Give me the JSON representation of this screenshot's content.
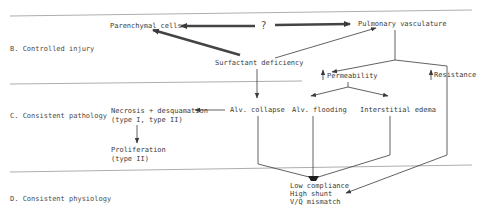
{
  "sections": {
    "b": "B.  Controlled injury",
    "c": "C.  Consistent pathology",
    "d": "D.  Consistent physiology"
  },
  "nodes": {
    "parenchymal_cells": "Parenchymal cells",
    "question": "?",
    "pulmonary_vasculature": "Pulmonary vasculature",
    "surfactant_deficiency": "Surfactant deficiency",
    "permeability": "Permeability",
    "resistance": "Resistance",
    "necrosis_line1": "Necrosis + desquamation",
    "necrosis_line2": "(type I, type II)",
    "alv_collapse": "Alv. collapse",
    "alv_flooding": "Alv. flooding",
    "interstitial_edema": "Interstitial edema",
    "proliferation_line1": "Proliferation",
    "proliferation_line2": "(type II)",
    "outcome_line1": "Low compliance",
    "outcome_line2": "High shunt",
    "outcome_line3": "V/Q mismatch"
  },
  "indicators": {
    "permeability": "up-arrow",
    "resistance": "up-arrow"
  }
}
